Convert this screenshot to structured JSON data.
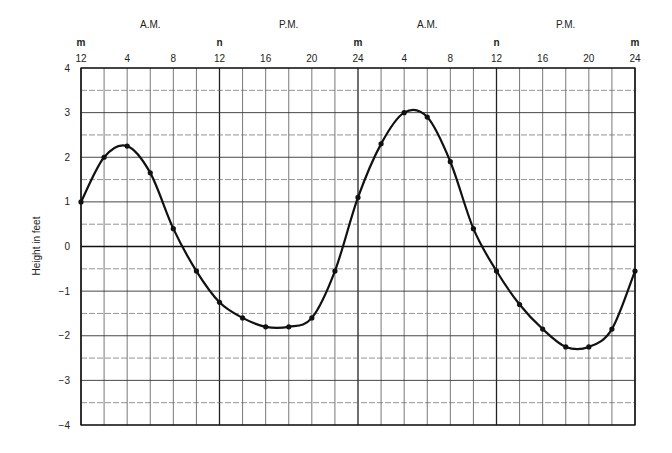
{
  "chart_data": {
    "type": "line",
    "title": "",
    "xlabel": "",
    "ylabel": "Height in feet",
    "ylim": [
      -4,
      4
    ],
    "xlim": [
      0,
      48
    ],
    "grid": true,
    "legend": null,
    "yticks": [
      "4",
      "3",
      "2",
      "1",
      "0",
      "-1",
      "-2",
      "-3",
      "-4"
    ],
    "xticks": [
      {
        "x": 0,
        "label": "12"
      },
      {
        "x": 4,
        "label": "4"
      },
      {
        "x": 8,
        "label": "8"
      },
      {
        "x": 12,
        "label": "12"
      },
      {
        "x": 16,
        "label": "16"
      },
      {
        "x": 20,
        "label": "20"
      },
      {
        "x": 24,
        "label": "24"
      },
      {
        "x": 28,
        "label": "4"
      },
      {
        "x": 32,
        "label": "8"
      },
      {
        "x": 36,
        "label": "12"
      },
      {
        "x": 40,
        "label": "16"
      },
      {
        "x": 44,
        "label": "20"
      },
      {
        "x": 48,
        "label": "24"
      }
    ],
    "markers": [
      {
        "x": 0,
        "label": "m"
      },
      {
        "x": 12,
        "label": "n"
      },
      {
        "x": 24,
        "label": "m"
      },
      {
        "x": 36,
        "label": "n"
      },
      {
        "x": 48,
        "label": "m"
      }
    ],
    "periods": [
      {
        "x": 6,
        "label": "A.M."
      },
      {
        "x": 18,
        "label": "P.M."
      },
      {
        "x": 30,
        "label": "A.M."
      },
      {
        "x": 42,
        "label": "P.M."
      }
    ],
    "series": [
      {
        "name": "Tide height",
        "x": [
          0,
          2,
          4,
          6,
          8,
          10,
          12,
          14,
          16,
          18,
          20,
          22,
          24,
          26,
          28,
          30,
          32,
          34,
          36,
          38,
          40,
          42,
          44,
          46,
          48
        ],
        "values": [
          1.0,
          2.0,
          2.25,
          1.65,
          0.4,
          -0.55,
          -1.25,
          -1.6,
          -1.8,
          -1.8,
          -1.6,
          -0.55,
          1.1,
          2.3,
          3.0,
          2.9,
          1.9,
          0.4,
          -0.55,
          -1.3,
          -1.85,
          -2.25,
          -2.25,
          -1.85,
          -0.55
        ]
      }
    ]
  }
}
